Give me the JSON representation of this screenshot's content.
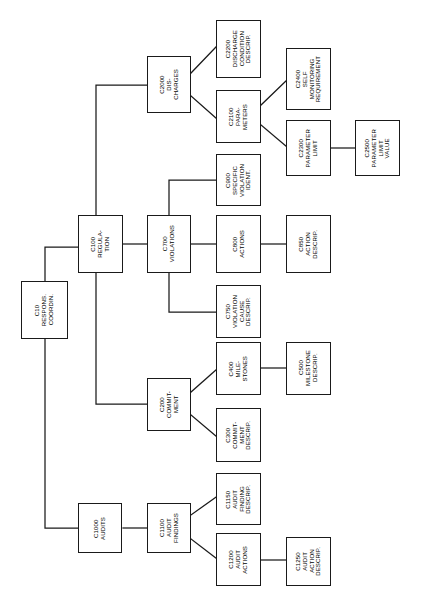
{
  "diagram": {
    "orientation": "left-to-right tree, rotated text (vertical, bottom-to-top)",
    "background_color": "#ffffff",
    "line_color": "#1a1a1a",
    "box_fill": "#ffffff",
    "nodes": [
      {
        "id": "C10",
        "code": "C10",
        "name": "RESPONS.\nCOORDIN.",
        "label": "C10\nRESPONS.\nCOORDIN.",
        "x": 21,
        "y": 281,
        "w": 47,
        "h": 58
      },
      {
        "id": "C100",
        "code": "C100",
        "name": "REGULA-\nTION",
        "label": "C100\nREGULA-\nTION",
        "x": 78,
        "y": 215,
        "w": 45,
        "h": 58
      },
      {
        "id": "C700",
        "code": "C700",
        "name": "VIOLATIONS",
        "label": "C700\nVIOLATIONS",
        "x": 147,
        "y": 215,
        "w": 44,
        "h": 58
      },
      {
        "id": "C2000",
        "code": "C2000",
        "name": "DIS-\nCHARGES",
        "label": "C2000\nDIS-\nCHARGES",
        "x": 147,
        "y": 56,
        "w": 44,
        "h": 57
      },
      {
        "id": "C2200",
        "code": "C2200",
        "name": "DISCHARGE\nCONDITION\nDESCRIP.",
        "label": "C2200\nDISCHARGE\nCONDITION\nDESCRIP.",
        "x": 216,
        "y": 20,
        "w": 45,
        "h": 58
      },
      {
        "id": "C2100",
        "code": "C2100",
        "name": "PARA-\nMETERS",
        "label": "C2100\nPARA-\nMETERS",
        "x": 216,
        "y": 90,
        "w": 45,
        "h": 53
      },
      {
        "id": "C2400",
        "code": "C2400",
        "name": "SELF\nMONITORING\nREQUIREMENT",
        "label": "C2400\nSELF\nMONITORING\nREQUIREMENT",
        "x": 286,
        "y": 48,
        "w": 45,
        "h": 62
      },
      {
        "id": "C2300",
        "code": "C2300",
        "name": "PARAMETER\nLIMIT",
        "label": "C2300\nPARAMETER\nLIMIT",
        "x": 286,
        "y": 120,
        "w": 45,
        "h": 56
      },
      {
        "id": "C2500",
        "code": "C2500",
        "name": "PARAMETER\nLIMIT\nVALUE",
        "label": "C2500\nPARAMETER\nLIMIT\nVALUE",
        "x": 355,
        "y": 120,
        "w": 45,
        "h": 56
      },
      {
        "id": "C900",
        "code": "C900",
        "name": "SPECIFIC\nVIOLATION\nIDENT.",
        "label": "C900\nSPECIFIC\nVIOLATION\nIDENT.",
        "x": 216,
        "y": 154,
        "w": 45,
        "h": 52
      },
      {
        "id": "C800",
        "code": "C800",
        "name": "ACTIONS",
        "label": "C800\nACTIONS",
        "x": 216,
        "y": 215,
        "w": 45,
        "h": 58
      },
      {
        "id": "C850",
        "code": "C850",
        "name": "ACTION\nDESCRIP.",
        "label": "C850\nACTION\nDESCRIP.",
        "x": 286,
        "y": 215,
        "w": 45,
        "h": 58
      },
      {
        "id": "C750",
        "code": "C750",
        "name": "VIOLATION\nCAUSE\nDESCRIP.",
        "label": "C750\nVIOLATION\nCAUSE\nDESCRIP.",
        "x": 216,
        "y": 285,
        "w": 45,
        "h": 53
      },
      {
        "id": "C200",
        "code": "C200",
        "name": "COMMIT-\nMENT",
        "label": "C200\nCOMMIT-\nMENT",
        "x": 147,
        "y": 378,
        "w": 44,
        "h": 53
      },
      {
        "id": "C400",
        "code": "C400",
        "name": "MILE-\nSTONES",
        "label": "C400\nMILE-\nSTONES",
        "x": 216,
        "y": 342,
        "w": 45,
        "h": 53
      },
      {
        "id": "C500",
        "code": "C500",
        "name": "MILESTONE\nDESCRIP.",
        "label": "C500\nMILESTONE\nDESCRIP.",
        "x": 286,
        "y": 342,
        "w": 45,
        "h": 53
      },
      {
        "id": "C300",
        "code": "C300",
        "name": "COMMIT-\nMENT\nDESCRIP.",
        "label": "C300\nCOMMIT-\nMENT\nDESCRIP.",
        "x": 216,
        "y": 408,
        "w": 45,
        "h": 54
      },
      {
        "id": "C1000",
        "code": "C1000",
        "name": "AUDITS",
        "label": "C1000\nAUDITS",
        "x": 78,
        "y": 503,
        "w": 44,
        "h": 50
      },
      {
        "id": "C1100",
        "code": "C1100",
        "name": "AUDIT\nFINDINGS",
        "label": "C1100\nAUDIT\nFINDINGS",
        "x": 147,
        "y": 503,
        "w": 44,
        "h": 50
      },
      {
        "id": "C1150",
        "code": "C1150",
        "name": "AUDIT\nFINDING\nDESCRIP.",
        "label": "C1150\nAUDIT\nFINDING\nDESCRIP.",
        "x": 216,
        "y": 473,
        "w": 45,
        "h": 52
      },
      {
        "id": "C1200",
        "code": "C1200",
        "name": "AUDIT\nACTIONS",
        "label": "C1200\nAUDIT\nACTIONS",
        "x": 216,
        "y": 533,
        "w": 45,
        "h": 53
      },
      {
        "id": "C1250",
        "code": "C1250",
        "name": "AUDIT\nACTION\nDESCRIP.",
        "label": "C1250\nAUDIT\nACTION\nDESCRIP.",
        "x": 286,
        "y": 537,
        "w": 45,
        "h": 49
      }
    ],
    "edges": [
      {
        "from": "C10",
        "to": "C100",
        "style": "orthogonal"
      },
      {
        "from": "C10",
        "to": "C1000",
        "style": "orthogonal"
      },
      {
        "from": "C100",
        "to": "C2000",
        "style": "orthogonal"
      },
      {
        "from": "C100",
        "to": "C700",
        "style": "straight"
      },
      {
        "from": "C100",
        "to": "C200",
        "style": "orthogonal"
      },
      {
        "from": "C2000",
        "to": "C2200",
        "style": "diagonal"
      },
      {
        "from": "C2000",
        "to": "C2100",
        "style": "diagonal"
      },
      {
        "from": "C2100",
        "to": "C2400",
        "style": "diagonal"
      },
      {
        "from": "C2100",
        "to": "C2300",
        "style": "diagonal"
      },
      {
        "from": "C2300",
        "to": "C2500",
        "style": "straight"
      },
      {
        "from": "C700",
        "to": "C900",
        "style": "orthogonal"
      },
      {
        "from": "C700",
        "to": "C800",
        "style": "straight"
      },
      {
        "from": "C700",
        "to": "C750",
        "style": "orthogonal"
      },
      {
        "from": "C800",
        "to": "C850",
        "style": "straight"
      },
      {
        "from": "C200",
        "to": "C400",
        "style": "diagonal"
      },
      {
        "from": "C200",
        "to": "C300",
        "style": "diagonal"
      },
      {
        "from": "C400",
        "to": "C500",
        "style": "straight"
      },
      {
        "from": "C1000",
        "to": "C1100",
        "style": "straight"
      },
      {
        "from": "C1100",
        "to": "C1150",
        "style": "diagonal"
      },
      {
        "from": "C1100",
        "to": "C1200",
        "style": "diagonal"
      },
      {
        "from": "C1200",
        "to": "C1250",
        "style": "straight"
      }
    ],
    "wire_paths": [
      "M 45 281 L 45 247 L 78 247",
      "M 45 339 L 45 528 L 78 528",
      "M 96 215 L 96 85 L 147 85",
      "M 123 244 L 147 244",
      "M 96 273 L 96 404 L 147 404",
      "M 191 73 L 216 47",
      "M 191 96 L 216 118",
      "M 261 105 L 286 81",
      "M 261 125 L 286 146",
      "M 331 148 L 355 148",
      "M 169 215 L 169 180 L 216 180",
      "M 191 244 L 216 244",
      "M 169 273 L 169 312 L 216 312",
      "M 261 244 L 286 244",
      "M 191 392 L 216 370",
      "M 191 415 L 216 436",
      "M 261 368 L 286 368",
      "M 123 528 L 147 528",
      "M 191 515 L 216 497",
      "M 191 539 L 216 558",
      "M 261 560 L 286 560"
    ]
  }
}
